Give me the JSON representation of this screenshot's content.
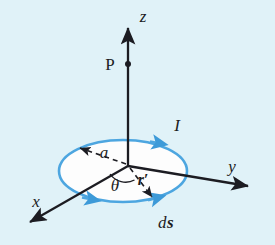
{
  "figure": {
    "background_color": "#e0f2f8",
    "loop_color": "#4da6e0",
    "axis_color": "#1c1c22",
    "loop_fill": "#fdfdfd"
  },
  "axes": {
    "z": {
      "label": "z",
      "x": 143,
      "y": 22
    },
    "y": {
      "label": "y",
      "x": 232,
      "y": 172
    },
    "x": {
      "label": "x",
      "x": 36,
      "y": 207
    }
  },
  "points": {
    "p": {
      "label": "P",
      "x": 110,
      "y": 69,
      "dot_x": 128,
      "dot_y": 64
    }
  },
  "annotations": {
    "radius": {
      "label": "a",
      "x": 104,
      "y": 158
    },
    "current": {
      "label": "I",
      "x": 177,
      "y": 131
    },
    "angle": {
      "label": "θ",
      "x": 115,
      "y": 190
    },
    "position_vector": {
      "label": "r′",
      "x": 140,
      "y": 185
    },
    "line_element_d": {
      "label": "d",
      "x": 163,
      "y": 227
    },
    "line_element_s": {
      "label": "s",
      "x": 173,
      "y": 227
    }
  },
  "geometry": {
    "origin_x": 128,
    "origin_y": 166,
    "ellipse_cx": 123,
    "ellipse_cy": 171,
    "ellipse_rx": 64,
    "ellipse_ry": 31
  }
}
